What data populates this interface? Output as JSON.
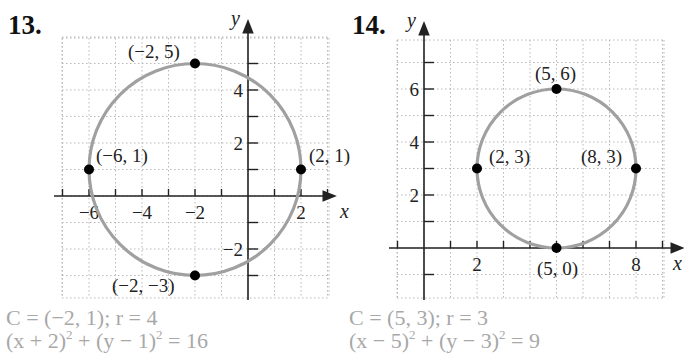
{
  "problems": [
    {
      "number": "13.",
      "answer_center": "C = (−2, 1); r = 4",
      "answer_eq_left": "(x + 2)",
      "answer_eq_mid": " + (y − 1)",
      "answer_eq_right": " = 16",
      "exp": "2"
    },
    {
      "number": "14.",
      "answer_center": "C = (5, 3); r = 3",
      "answer_eq_left": "(x − 5)",
      "answer_eq_mid": " + (y − 3)",
      "answer_eq_right": " = 9",
      "exp": "2"
    }
  ],
  "chart_data": [
    {
      "type": "scatter",
      "title": "13.",
      "xlabel": "x",
      "ylabel": "y",
      "xlim": [
        -7,
        3
      ],
      "ylim": [
        -4,
        6
      ],
      "grid": true,
      "x_tick_labels": [
        "−6",
        "−4",
        "−2",
        "2"
      ],
      "y_tick_labels": [
        "4",
        "2",
        "−2"
      ],
      "circle": {
        "center": [
          -2,
          1
        ],
        "radius": 4,
        "color": "#a0a0a0"
      },
      "points": [
        {
          "x": -2,
          "y": 5,
          "label": "(−2, 5)"
        },
        {
          "x": -6,
          "y": 1,
          "label": "(−6, 1)"
        },
        {
          "x": 2,
          "y": 1,
          "label": "(2, 1)"
        },
        {
          "x": -2,
          "y": -3,
          "label": "(−2, −3)"
        }
      ],
      "annotation": "C = (−2, 1); r = 4; (x + 2)^2 + (y − 1)^2 = 16"
    },
    {
      "type": "scatter",
      "title": "14.",
      "xlabel": "x",
      "ylabel": "y",
      "xlim": [
        -1,
        9
      ],
      "ylim": [
        -2,
        8
      ],
      "grid": true,
      "x_tick_labels": [
        "2",
        "8"
      ],
      "y_tick_labels": [
        "6",
        "4",
        "2"
      ],
      "circle": {
        "center": [
          5,
          3
        ],
        "radius": 3,
        "color": "#a0a0a0"
      },
      "points": [
        {
          "x": 5,
          "y": 6,
          "label": "(5, 6)"
        },
        {
          "x": 2,
          "y": 3,
          "label": "(2, 3)"
        },
        {
          "x": 8,
          "y": 3,
          "label": "(8, 3)"
        },
        {
          "x": 5,
          "y": 0,
          "label": "(5, 0)"
        }
      ],
      "annotation": "C = (5, 3); r = 3; (x − 5)^2 + (y − 3)^2 = 9"
    }
  ]
}
